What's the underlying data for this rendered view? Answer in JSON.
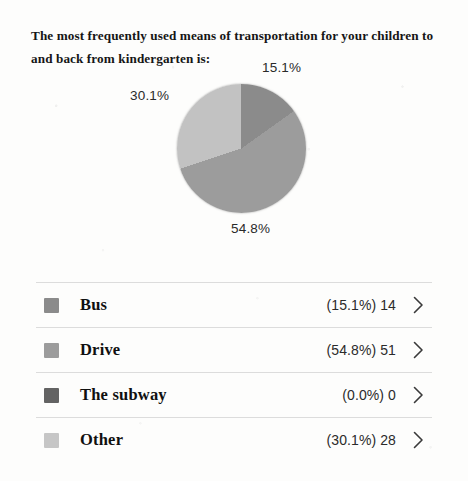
{
  "title": "The most frequently used means of transportation for your children to and back from kindergarten is:",
  "chart_data": {
    "type": "pie",
    "title": "The most frequently used means of transportation for your children to and back from kindergarten is:",
    "categories": [
      "Bus",
      "Drive",
      "The subway",
      "Other"
    ],
    "values": [
      14,
      51,
      0,
      28
    ],
    "percentages": [
      15.1,
      54.8,
      0.0,
      30.1
    ],
    "total": 93,
    "labels_shown": [
      "15.1%",
      "54.8%",
      "30.1%"
    ],
    "colors": [
      "#8b8b8b",
      "#9c9c9c",
      "#636363",
      "#c2c2c2"
    ],
    "legend_position": "below",
    "start_angle_deg": 0,
    "direction": "clockwise",
    "grid": false
  },
  "pie_labels": {
    "bus": "15.1%",
    "drive": "54.8%",
    "other": "30.1%"
  },
  "legend": {
    "rows": [
      {
        "label": "Bus",
        "value": "(15.1%) 14",
        "swatch": "#8b8b8b",
        "chevron": "chevron-right-icon"
      },
      {
        "label": "Drive",
        "value": "(54.8%) 51",
        "swatch": "#9c9c9c",
        "chevron": "chevron-right-icon"
      },
      {
        "label": "The subway",
        "value": "(0.0%) 0",
        "swatch": "#636363",
        "chevron": "chevron-right-icon"
      },
      {
        "label": "Other",
        "value": "(30.1%) 28",
        "swatch": "#c6c6c6",
        "chevron": "chevron-right-icon"
      }
    ]
  }
}
